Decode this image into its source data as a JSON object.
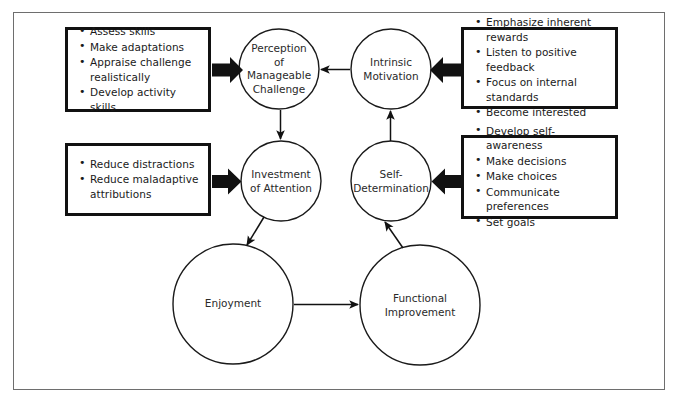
{
  "diagram": {
    "type": "cycle-flow-diagram",
    "frame_color": "#6e6e6e",
    "box_border_color": "#111111",
    "circle_stroke_color": "#1a1a1a",
    "arrow_color": "#111111",
    "text_color": "#1a1a1a",
    "nodes": [
      {
        "id": "perception",
        "label": "Perception\nof\nManageable\nChallenge",
        "cx": 279,
        "cy": 69,
        "r": 40
      },
      {
        "id": "intrinsic",
        "label": "Intrinsic\nMotivation",
        "cx": 391,
        "cy": 69,
        "r": 40
      },
      {
        "id": "investment",
        "label": "Investment\nof Attention",
        "cx": 281,
        "cy": 181,
        "r": 40
      },
      {
        "id": "selfdet",
        "label": "Self-\nDetermination",
        "cx": 391,
        "cy": 181,
        "r": 40
      },
      {
        "id": "enjoyment",
        "label": "Enjoyment",
        "cx": 233,
        "cy": 304,
        "r": 60
      },
      {
        "id": "functional",
        "label": "Functional\nImprovement",
        "cx": 420,
        "cy": 305,
        "r": 60
      }
    ],
    "boxes": [
      {
        "id": "box-perception",
        "x": 65,
        "y": 27,
        "width": 146,
        "height": 85,
        "target": "perception",
        "arrow_direction": "right",
        "items": [
          "Assess skills",
          "Make adaptations",
          "Appraise challenge realistically",
          "Develop activity skills"
        ]
      },
      {
        "id": "box-intrinsic",
        "x": 461,
        "y": 27,
        "width": 157,
        "height": 82,
        "target": "intrinsic",
        "arrow_direction": "left",
        "items": [
          "Emphasize inherent rewards",
          "Listen to positive feedback",
          "Focus on internal standards",
          "Become interested"
        ]
      },
      {
        "id": "box-investment",
        "x": 65,
        "y": 143,
        "width": 146,
        "height": 73,
        "target": "investment",
        "arrow_direction": "right",
        "items": [
          "Reduce distractions",
          "Reduce maladaptive attributions"
        ]
      },
      {
        "id": "box-selfdetermination",
        "x": 461,
        "y": 135,
        "width": 157,
        "height": 84,
        "target": "selfdet",
        "arrow_direction": "left",
        "items": [
          "Develop self-awareness",
          "Make decisions",
          "Make choices",
          "Communicate preferences",
          "Set goals"
        ]
      }
    ],
    "connectors": [
      {
        "id": "intrinsic-to-perception",
        "from": "intrinsic",
        "to": "perception",
        "style": "thin",
        "direction": "left"
      },
      {
        "id": "perception-to-investment",
        "from": "perception",
        "to": "investment",
        "style": "thin",
        "direction": "down"
      },
      {
        "id": "selfdet-to-intrinsic",
        "from": "selfdet",
        "to": "intrinsic",
        "style": "thin",
        "direction": "up"
      },
      {
        "id": "investment-to-enjoyment",
        "from": "investment",
        "to": "enjoyment",
        "style": "thin",
        "direction": "down-left"
      },
      {
        "id": "enjoyment-to-functional",
        "from": "enjoyment",
        "to": "functional",
        "style": "thin",
        "direction": "right"
      },
      {
        "id": "functional-to-selfdet",
        "from": "functional",
        "to": "selfdet",
        "style": "thin",
        "direction": "up-left"
      }
    ]
  }
}
